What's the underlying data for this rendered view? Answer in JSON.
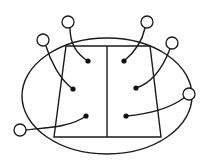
{
  "diagram": {
    "colors": {
      "line": "#1a1a1a",
      "background": "#ffffff",
      "dot": "#111111"
    },
    "ellipse": {
      "cx": 107,
      "cy": 96,
      "rx": 85,
      "ry": 58
    },
    "trapezoid": {
      "points": "66,46 150,46 161,137 54,137"
    },
    "divider": {
      "x1": 107,
      "y1": 46,
      "x2": 107,
      "y2": 137
    },
    "connections": [
      {
        "id": "left-top",
        "dot": [
          88,
          61
        ],
        "node": [
          68,
          22
        ],
        "path": "M88,61 C78,55 70,45 70,28"
      },
      {
        "id": "left-middle",
        "dot": [
          73,
          89
        ],
        "node": [
          43,
          40
        ],
        "path": "M73,89 C60,80 50,60 46,46"
      },
      {
        "id": "left-bottom",
        "dot": [
          86,
          116
        ],
        "node": [
          20,
          130
        ],
        "path": "M86,116 C70,128 40,128 26,130"
      },
      {
        "id": "right-top",
        "dot": [
          124,
          61
        ],
        "node": [
          147,
          22
        ],
        "path": "M124,61 C135,52 142,42 145,28"
      },
      {
        "id": "right-middle",
        "dot": [
          136,
          88
        ],
        "node": [
          172,
          43
        ],
        "path": "M136,88 C155,82 165,62 170,49"
      },
      {
        "id": "right-bottom",
        "dot": [
          126,
          116
        ],
        "node": [
          189,
          94
        ],
        "path": "M126,116 C150,114 170,108 184,98"
      }
    ],
    "node_radius": 6,
    "dot_radius": 2.6
  }
}
